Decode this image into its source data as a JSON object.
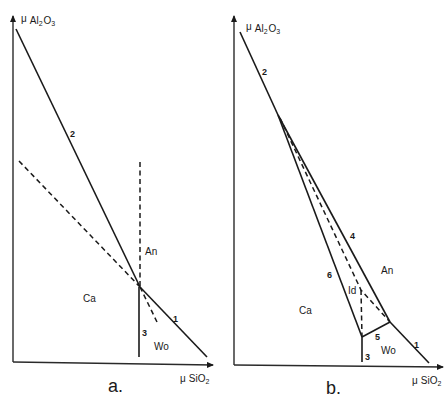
{
  "figure": {
    "panels": [
      {
        "id": "a",
        "caption": "a.",
        "y_axis": {
          "mu": "μ",
          "species": "Al",
          "sub1": "2",
          "o": "O",
          "sub2": "3"
        },
        "x_axis": {
          "mu": "μ",
          "species": "SiO",
          "sub": "2"
        },
        "regions": {
          "An": "An",
          "Ca": "Ca",
          "Wo": "Wo"
        },
        "line_labels": {
          "l1": "1",
          "l2": "2",
          "l3": "3"
        }
      },
      {
        "id": "b",
        "caption": "b.",
        "y_axis": {
          "mu": "μ",
          "species": "Al",
          "sub1": "2",
          "o": "O",
          "sub2": "3"
        },
        "x_axis": {
          "mu": "μ",
          "species": "SiO",
          "sub": "2"
        },
        "regions": {
          "An": "An",
          "Ca": "Ca",
          "Wo": "Wo",
          "Id": "Id"
        },
        "line_labels": {
          "l1": "1",
          "l2": "2",
          "l3": "3",
          "l4": "4",
          "l5": "5",
          "l6": "6"
        }
      }
    ]
  },
  "colors": {
    "ink": "#1a1a1a",
    "background": "#ffffff"
  }
}
